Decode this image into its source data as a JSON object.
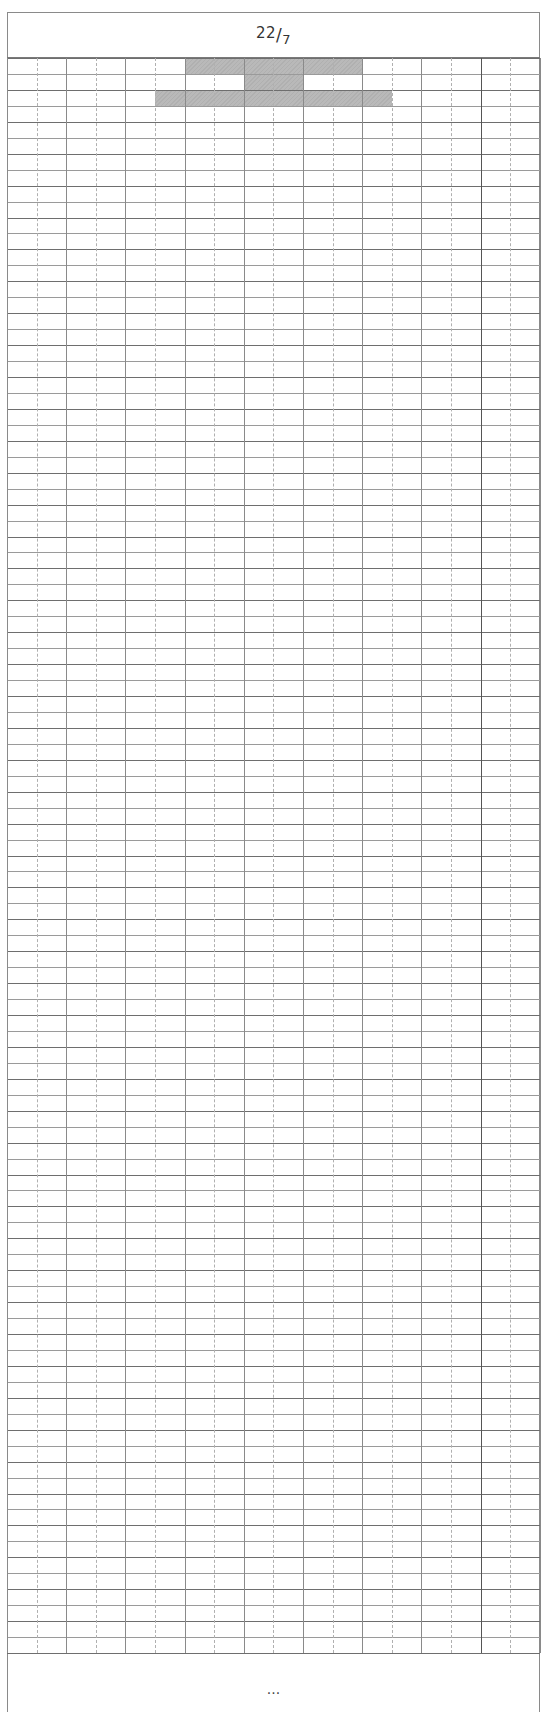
{
  "page": {
    "title": {
      "numerator": "22",
      "slash": "/",
      "denominator": "7"
    },
    "footer_text": "..."
  },
  "grid": {
    "rows": 100,
    "columns": 18,
    "major_column_every": 2,
    "major_row_every": 2,
    "row_height_px": 15.95,
    "column_width_px": 29.6,
    "shade_color": "#b9b9b9",
    "line_color": "#7a7a7a",
    "dashed_line_color": "#b0b0b0",
    "shaded_cells": [
      {
        "row": 0,
        "col_start": 6,
        "col_end": 11
      },
      {
        "row": 1,
        "col_start": 8,
        "col_end": 9
      },
      {
        "row": 2,
        "col_start": 5,
        "col_end": 12
      }
    ]
  }
}
